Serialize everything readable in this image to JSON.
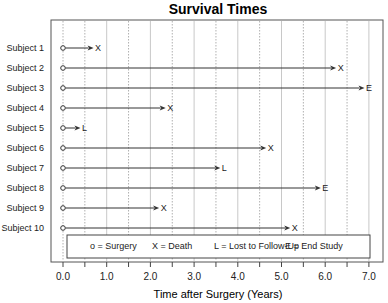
{
  "chart_data": {
    "type": "timeline",
    "title": "Survival Times",
    "xlabel": "Time after Surgery (Years)",
    "ylabel": "",
    "xlim": [
      0,
      7.2
    ],
    "xticks": [
      "0.0",
      "1.0",
      "2.0",
      "3.0",
      "4.0",
      "5.0",
      "6.0",
      "7.0"
    ],
    "grid": {
      "solid_at_integers": true,
      "dotted_at_half_years": true
    },
    "legend_position": "bottom-inside",
    "legend": [
      {
        "symbol": "o",
        "meaning": "Surgery",
        "text": "o = Surgery"
      },
      {
        "symbol": "X",
        "meaning": "Death",
        "text": "X = Death"
      },
      {
        "symbol": "L",
        "meaning": "Lost to Follow-Up",
        "text": "L = Lost to Follow-Up"
      },
      {
        "symbol": "E",
        "meaning": "End Study",
        "text": "E = End Study"
      }
    ],
    "categories": [
      "Subject 1",
      "Subject 2",
      "Subject 3",
      "Subject 4",
      "Subject 5",
      "Subject 6",
      "Subject 7",
      "Subject 8",
      "Subject 9",
      "Subject 10"
    ],
    "subjects": [
      {
        "label": "Subject 1",
        "start": 0.0,
        "end": 0.7,
        "outcome": "X"
      },
      {
        "label": "Subject 2",
        "start": 0.0,
        "end": 6.25,
        "outcome": "X"
      },
      {
        "label": "Subject 3",
        "start": 0.0,
        "end": 6.9,
        "outcome": "E"
      },
      {
        "label": "Subject 4",
        "start": 0.0,
        "end": 2.35,
        "outcome": "X"
      },
      {
        "label": "Subject 5",
        "start": 0.0,
        "end": 0.4,
        "outcome": "L"
      },
      {
        "label": "Subject 6",
        "start": 0.0,
        "end": 4.65,
        "outcome": "X"
      },
      {
        "label": "Subject 7",
        "start": 0.0,
        "end": 3.6,
        "outcome": "L"
      },
      {
        "label": "Subject 8",
        "start": 0.0,
        "end": 5.9,
        "outcome": "E"
      },
      {
        "label": "Subject 9",
        "start": 0.0,
        "end": 2.2,
        "outcome": "X"
      },
      {
        "label": "Subject 10",
        "start": 0.0,
        "end": 5.2,
        "outcome": "X"
      }
    ]
  },
  "colors": {
    "line": "#333333",
    "frame": "#555555",
    "grid_solid": "#c8c8c8",
    "grid_dotted": "#b0b0b0",
    "text": "#222222"
  }
}
